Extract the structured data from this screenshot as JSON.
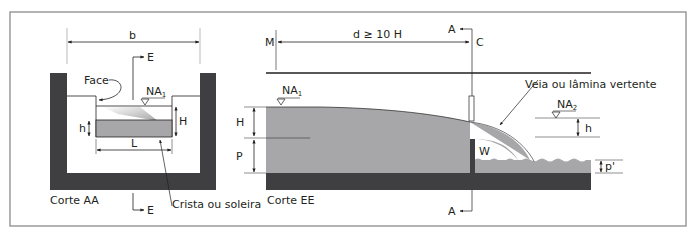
{
  "colors": {
    "frame": "#9a9a9a",
    "structure": "#3f3f41",
    "water": "#a7a7a9",
    "water_light": "#cfcfd1",
    "line": "#231f20"
  },
  "left_view": {
    "title": "Corte AA",
    "width_label": "b",
    "section_marker_top": "E",
    "section_marker_bottom": "E",
    "face_label": "Face",
    "water_level_label": "NA",
    "water_level_sub": "1",
    "head_label": "H",
    "crest_height_label": "h",
    "crest_length_label": "L",
    "crest_label": "Crista ou soleira"
  },
  "right_view": {
    "title": "Corte EE",
    "measure_point_label": "M",
    "distance_label": "d ≥ 10 H",
    "section_marker_top": "A",
    "section_marker_bottom": "A",
    "weir_point_label": "C",
    "upstream_level_label": "NA",
    "upstream_level_sub": "1",
    "head_label": "H",
    "weir_height_label": "P",
    "nappe_label": "Veia ou lâmina vertente",
    "air_pocket_label": "W",
    "downstream_level_label": "NA",
    "downstream_level_sub": "2",
    "downstream_h_label": "h",
    "downstream_p_label": "p'"
  }
}
